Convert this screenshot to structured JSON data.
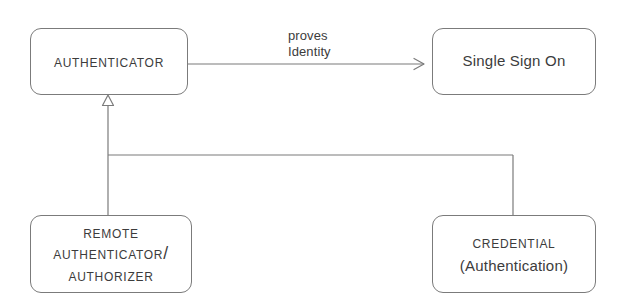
{
  "diagram": {
    "type": "uml-class-diagram",
    "background_color": "#ffffff",
    "line_color": "#7b7b7b",
    "text_color": "#3c3c3c",
    "nodes": [
      {
        "id": "authenticator",
        "label": "Authenticator",
        "style": "small-caps",
        "x": 30,
        "y": 28,
        "width": 158,
        "height": 67
      },
      {
        "id": "single-sign-on",
        "label": "Single Sign On",
        "style": "mixed-case",
        "x": 432,
        "y": 28,
        "width": 164,
        "height": 67
      },
      {
        "id": "remote-authenticator",
        "label": "Remote\nAuthenticator/\nAuthorizer",
        "style": "small-caps",
        "x": 30,
        "y": 215,
        "width": 162,
        "height": 78
      },
      {
        "id": "credential",
        "label_line_1": "Credential",
        "label_line_2": "(Authentication)",
        "style": "small-caps",
        "x": 432,
        "y": 215,
        "width": 164,
        "height": 78
      }
    ],
    "edges": [
      {
        "id": "proves-identity",
        "from": "authenticator",
        "to": "single-sign-on",
        "label": "proves\nIdentity",
        "arrowhead": "open-arrow"
      },
      {
        "id": "remote-authenticator-generalization",
        "from": "remote-authenticator",
        "to": "authenticator",
        "label": "",
        "arrowhead": "hollow-triangle"
      },
      {
        "id": "credential-generalization",
        "from": "credential",
        "to": "authenticator",
        "label": "",
        "arrowhead": "hollow-triangle-shared"
      }
    ]
  }
}
